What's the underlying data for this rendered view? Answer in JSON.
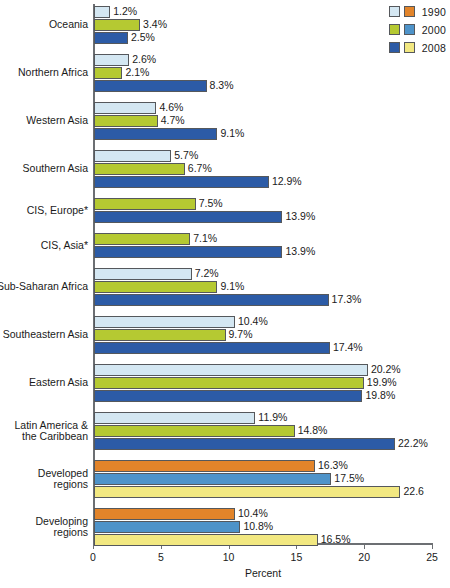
{
  "legend": {
    "position": "top-right",
    "rows": [
      {
        "label": "1990",
        "swatch_a": "#d4e7f2",
        "swatch_b": "#e2842a"
      },
      {
        "label": "2000",
        "swatch_a": "#b5c932",
        "swatch_b": "#4e93c9"
      },
      {
        "label": "2008",
        "swatch_a": "#2c5ba6",
        "swatch_b": "#f2e881"
      }
    ]
  },
  "axis": {
    "x_title": "Percent",
    "x_ticks": [
      "0",
      "5",
      "10",
      "15",
      "20",
      "25"
    ],
    "x_min": 0,
    "x_max": 25
  },
  "colors": {
    "set_a_1990": "#d4e7f2",
    "set_a_2000": "#b5c932",
    "set_a_2008": "#2c5ba6",
    "set_b_1990": "#e2842a",
    "set_b_2000": "#4e93c9",
    "set_b_2008": "#f2e881",
    "bar_outline": "#55585c",
    "axis": "#6c6f73"
  },
  "chart_data": {
    "type": "bar",
    "orientation": "horizontal",
    "title": "",
    "xlabel": "Percent",
    "ylabel": "",
    "xlim": [
      0,
      25
    ],
    "grid": false,
    "legend_position": "top-right",
    "categories": [
      "Oceania",
      "Northern Africa",
      "Western Asia",
      "Southern Asia",
      "CIS, Europe*",
      "CIS, Asia*",
      "Sub-Saharan Africa",
      "Southeastern Asia",
      "Eastern Asia",
      "Latin America &\nthe Caribbean",
      "Developed\nregions",
      "Developing\nregions"
    ],
    "series": [
      {
        "name": "1990",
        "values": [
          1.2,
          2.6,
          4.6,
          5.7,
          null,
          null,
          7.2,
          10.4,
          20.2,
          11.9,
          16.3,
          10.4
        ],
        "labels": [
          "1.2%",
          "2.6%",
          "4.6%",
          "5.7%",
          "",
          "",
          "7.2%",
          "10.4%",
          "20.2%",
          "11.9%",
          "16.3%",
          "10.4%"
        ]
      },
      {
        "name": "2000",
        "values": [
          3.4,
          2.1,
          4.7,
          6.7,
          7.5,
          7.1,
          9.1,
          9.7,
          19.9,
          14.8,
          17.5,
          10.8
        ],
        "labels": [
          "3.4%",
          "2.1%",
          "4.7%",
          "6.7%",
          "7.5%",
          "7.1%",
          "9.1%",
          "9.7%",
          "19.9%",
          "14.8%",
          "17.5%",
          "10.8%"
        ]
      },
      {
        "name": "2008",
        "values": [
          2.5,
          8.3,
          9.1,
          12.9,
          13.9,
          13.9,
          17.3,
          17.4,
          19.8,
          22.2,
          22.6,
          16.5
        ],
        "labels": [
          "2.5%",
          "8.3%",
          "9.1%",
          "12.9%",
          "13.9%",
          "13.9%",
          "17.3%",
          "17.4%",
          "19.8%",
          "22.2%",
          "22.6",
          "16.5%"
        ]
      }
    ],
    "group_color_set": [
      "a",
      "a",
      "a",
      "a",
      "a",
      "a",
      "a",
      "a",
      "a",
      "a",
      "b",
      "b"
    ]
  }
}
